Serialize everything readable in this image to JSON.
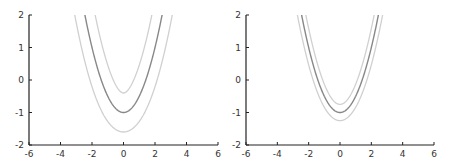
{
  "chart_data": [
    {
      "type": "line",
      "title": "",
      "xlabel": "",
      "ylabel": "",
      "xlim": [
        -6,
        6
      ],
      "ylim": [
        -2,
        2
      ],
      "xticks": [
        "-6",
        "-4",
        "-2",
        "0",
        "2",
        "4",
        "6"
      ],
      "yticks": [
        "-2",
        "-1",
        "0",
        "1",
        "2"
      ],
      "grid": false,
      "base_curve": "y = x^2/2 - 1",
      "offset": 0.6,
      "series": [
        {
          "name": "base",
          "color": "#888888",
          "vertex": [
            0,
            -1
          ]
        },
        {
          "name": "outer offset",
          "color": "#d0d0d0",
          "vertex": [
            0,
            -1.6
          ]
        },
        {
          "name": "inner offset (swallowtail)",
          "color": "#d0d0d0",
          "vertex": [
            0,
            -0.4
          ],
          "cusp_crossing": [
            0,
            -0.05
          ]
        }
      ]
    },
    {
      "type": "line",
      "title": "",
      "xlabel": "",
      "ylabel": "",
      "xlim": [
        -6,
        6
      ],
      "ylim": [
        -2,
        2
      ],
      "xticks": [
        "-6",
        "-4",
        "-2",
        "0",
        "2",
        "4",
        "6"
      ],
      "yticks": [
        "-2",
        "-1",
        "0",
        "1",
        "2"
      ],
      "grid": false,
      "base_curve": "y = x^2/2 - 1",
      "offset": 0.25,
      "series": [
        {
          "name": "base",
          "color": "#888888",
          "vertex": [
            0,
            -1
          ]
        },
        {
          "name": "outer offset",
          "color": "#d0d0d0",
          "vertex": [
            0,
            -1.25
          ]
        },
        {
          "name": "inner offset",
          "color": "#d0d0d0",
          "vertex": [
            0,
            -0.75
          ]
        }
      ]
    }
  ]
}
